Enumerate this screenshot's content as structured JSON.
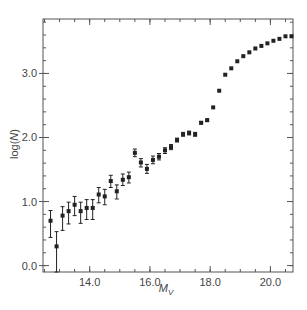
{
  "chart_data": {
    "type": "scatter",
    "title": "",
    "xlabel": "M_V",
    "xlabel_main": "M",
    "xlabel_sub": "V",
    "ylabel": "log(N)",
    "ylabel_prefix": "log(",
    "ylabel_var": "N",
    "ylabel_suffix": ")",
    "xlim": [
      12.45,
      20.75
    ],
    "ylim": [
      -0.1,
      3.85
    ],
    "xticks": [
      14.0,
      16.0,
      18.0,
      20.0
    ],
    "xtick_labels": [
      "14.0",
      "16.0",
      "18.0",
      "20.0"
    ],
    "xminor_step": 0.5,
    "yticks": [
      0.0,
      1.0,
      2.0,
      3.0
    ],
    "ytick_labels": [
      "0.0",
      "1.0",
      "2.0",
      "3.0"
    ],
    "yminor_step": 0.2,
    "grid": false,
    "legend": null,
    "marker_color": "#222222",
    "axis_color": "#555555",
    "points": [
      {
        "x": 12.7,
        "y": 0.7,
        "err_lo": 0.44,
        "err_hi": 0.86
      },
      {
        "x": 12.9,
        "y": 0.3,
        "err_lo": -0.1,
        "err_hi": 0.53
      },
      {
        "x": 13.1,
        "y": 0.78,
        "err_lo": 0.55,
        "err_hi": 0.92
      },
      {
        "x": 13.3,
        "y": 0.85,
        "err_lo": 0.65,
        "err_hi": 0.99
      },
      {
        "x": 13.5,
        "y": 0.95,
        "err_lo": 0.78,
        "err_hi": 1.08
      },
      {
        "x": 13.7,
        "y": 0.85,
        "err_lo": 0.66,
        "err_hi": 0.99
      },
      {
        "x": 13.9,
        "y": 0.9,
        "err_lo": 0.72,
        "err_hi": 1.03
      },
      {
        "x": 14.1,
        "y": 0.9,
        "err_lo": 0.72,
        "err_hi": 1.03
      },
      {
        "x": 14.3,
        "y": 1.11,
        "err_lo": 0.98,
        "err_hi": 1.22
      },
      {
        "x": 14.5,
        "y": 1.08,
        "err_lo": 0.95,
        "err_hi": 1.19
      },
      {
        "x": 14.7,
        "y": 1.32,
        "err_lo": 1.22,
        "err_hi": 1.41
      },
      {
        "x": 14.9,
        "y": 1.16,
        "err_lo": 1.04,
        "err_hi": 1.26
      },
      {
        "x": 15.1,
        "y": 1.34,
        "err_lo": 1.25,
        "err_hi": 1.43
      },
      {
        "x": 15.3,
        "y": 1.38,
        "err_lo": 1.29,
        "err_hi": 1.46
      },
      {
        "x": 15.5,
        "y": 1.76,
        "err_lo": 1.7,
        "err_hi": 1.82
      },
      {
        "x": 15.7,
        "y": 1.61,
        "err_lo": 1.54,
        "err_hi": 1.67
      },
      {
        "x": 15.9,
        "y": 1.51,
        "err_lo": 1.44,
        "err_hi": 1.58
      },
      {
        "x": 16.1,
        "y": 1.65,
        "err_lo": 1.59,
        "err_hi": 1.71
      },
      {
        "x": 16.3,
        "y": 1.7,
        "err_lo": 1.65,
        "err_hi": 1.75
      },
      {
        "x": 16.5,
        "y": 1.8,
        "err_lo": 1.75,
        "err_hi": 1.84
      },
      {
        "x": 16.7,
        "y": 1.85,
        "err_lo": 1.81,
        "err_hi": 1.89
      },
      {
        "x": 16.9,
        "y": 1.96,
        "err_lo": 1.93,
        "err_hi": 1.99
      },
      {
        "x": 17.1,
        "y": 2.05,
        "err_lo": 2.02,
        "err_hi": 2.08
      },
      {
        "x": 17.3,
        "y": 2.07,
        "err_lo": 2.04,
        "err_hi": 2.1
      },
      {
        "x": 17.5,
        "y": 2.05,
        "err_lo": 2.02,
        "err_hi": 2.08
      },
      {
        "x": 17.7,
        "y": 2.23,
        "err_lo": 2.21,
        "err_hi": 2.25
      },
      {
        "x": 17.9,
        "y": 2.27,
        "err_lo": 2.25,
        "err_hi": 2.29
      },
      {
        "x": 18.1,
        "y": 2.47,
        "err_lo": 2.47,
        "err_hi": 2.47
      },
      {
        "x": 18.3,
        "y": 2.73,
        "err_lo": 2.73,
        "err_hi": 2.73
      },
      {
        "x": 18.5,
        "y": 2.98,
        "err_lo": 2.98,
        "err_hi": 2.98
      },
      {
        "x": 18.7,
        "y": 3.08,
        "err_lo": 3.08,
        "err_hi": 3.08
      },
      {
        "x": 18.9,
        "y": 3.19,
        "err_lo": 3.19,
        "err_hi": 3.19
      },
      {
        "x": 19.1,
        "y": 3.27,
        "err_lo": 3.27,
        "err_hi": 3.27
      },
      {
        "x": 19.3,
        "y": 3.33,
        "err_lo": 3.33,
        "err_hi": 3.33
      },
      {
        "x": 19.5,
        "y": 3.39,
        "err_lo": 3.39,
        "err_hi": 3.39
      },
      {
        "x": 19.7,
        "y": 3.43,
        "err_lo": 3.43,
        "err_hi": 3.43
      },
      {
        "x": 19.9,
        "y": 3.47,
        "err_lo": 3.47,
        "err_hi": 3.47
      },
      {
        "x": 20.1,
        "y": 3.51,
        "err_lo": 3.51,
        "err_hi": 3.51
      },
      {
        "x": 20.3,
        "y": 3.54,
        "err_lo": 3.54,
        "err_hi": 3.54
      },
      {
        "x": 20.5,
        "y": 3.58,
        "err_lo": 3.58,
        "err_hi": 3.58
      },
      {
        "x": 20.7,
        "y": 3.58,
        "err_lo": 3.58,
        "err_hi": 3.58
      }
    ]
  }
}
